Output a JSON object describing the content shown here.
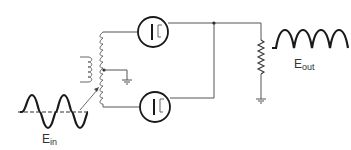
{
  "diagram": {
    "labels": {
      "input": {
        "main": "E",
        "sub": "in"
      },
      "output": {
        "main": "E",
        "sub": "out"
      }
    },
    "components": [
      {
        "type": "ac-input-waveform",
        "label": "Ein"
      },
      {
        "type": "center-tapped-transformer"
      },
      {
        "type": "ground",
        "position": "center-tap"
      },
      {
        "type": "diode-tube",
        "position": "top"
      },
      {
        "type": "diode-tube",
        "position": "bottom"
      },
      {
        "type": "load-resistor"
      },
      {
        "type": "ground",
        "position": "load"
      },
      {
        "type": "rectified-output-waveform",
        "label": "Eout"
      }
    ],
    "colors": {
      "line": "#1a1a1a",
      "wire": "#555555",
      "background": "#ffffff"
    }
  }
}
